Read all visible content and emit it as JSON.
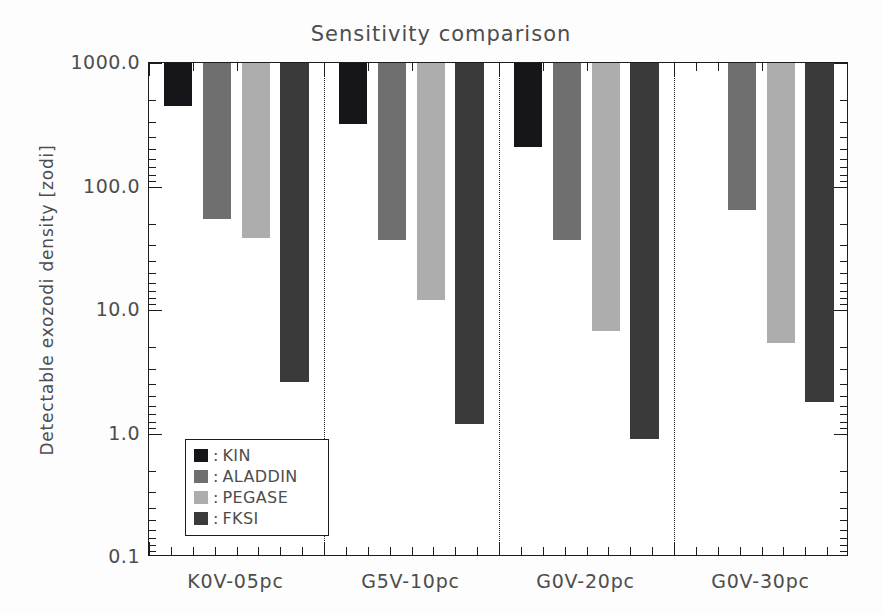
{
  "chart_data": {
    "type": "bar",
    "title": "Sensitivity comparison",
    "xlabel": "",
    "ylabel": "Detectable exozodi density [zodi]",
    "yscale": "log",
    "ylim": [
      0.1,
      1000.0
    ],
    "ytick_labels": [
      "0.1",
      "1.0",
      "10.0",
      "100.0",
      "1000.0"
    ],
    "ytick_values": [
      0.1,
      1.0,
      10.0,
      100.0,
      1000.0
    ],
    "grid": false,
    "legend_position": "lower-left-inside",
    "orientation": "downward-from-top",
    "categories": [
      "K0V-05pc",
      "G5V-10pc",
      "G0V-20pc",
      "G0V-30pc"
    ],
    "series": [
      {
        "name": "KIN",
        "color": "#16161a",
        "values": [
          450,
          320,
          210,
          null
        ]
      },
      {
        "name": "ALADDIN",
        "color": "#6f6f6f",
        "values": [
          55,
          37,
          37,
          65
        ]
      },
      {
        "name": "PEGASE",
        "color": "#adadad",
        "values": [
          38,
          12,
          6.8,
          5.4
        ]
      },
      {
        "name": "FKSI",
        "color": "#3a3a3a",
        "values": [
          2.6,
          1.2,
          0.9,
          1.8
        ]
      }
    ]
  },
  "legend": {
    "separator": ":",
    "entries": [
      {
        "label": "KIN",
        "color": "#16161a"
      },
      {
        "label": "ALADDIN",
        "color": "#6f6f6f"
      },
      {
        "label": "PEGASE",
        "color": "#adadad"
      },
      {
        "label": "FKSI",
        "color": "#3a3a3a"
      }
    ]
  },
  "colors": {
    "axis": "#1c1c1c",
    "text": "#4d4d4d",
    "background": "#ffffff",
    "separator": "#1c1c1c"
  }
}
